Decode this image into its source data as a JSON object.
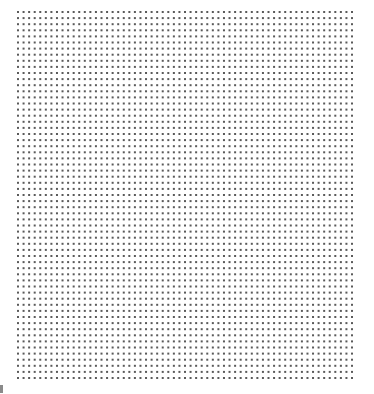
{
  "sheet": {
    "type": "dot-grid-paper",
    "rows": 61,
    "columns": 61,
    "dot_color": "#5a5a5a",
    "background_color": "#ffffff"
  },
  "corner_mark": {
    "description": "partially cropped glyph at bottom-left edge",
    "color": "#8a8a8a"
  }
}
